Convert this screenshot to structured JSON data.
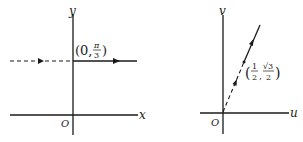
{
  "left_plot": {
    "x_axis_label": "x",
    "y_axis_label": "y",
    "origin_label": "O",
    "point_label": {
      "open": "(0,",
      "frac_num": "π",
      "frac_den": "3",
      "close": ")"
    },
    "line": {
      "description": "horizontal line y = π/3, dashed for x<0, solid for x>0, arrows pointing right"
    }
  },
  "right_plot": {
    "x_axis_label": "u",
    "y_axis_label": "v",
    "origin_label": "O",
    "point_label": {
      "open": "(",
      "frac1_num": "1",
      "frac1_den": "2",
      "sep": ",",
      "frac2_num": "√3",
      "frac2_den": "2",
      "close": ")"
    },
    "line": {
      "description": "ray from origin through (1/2, √3/2), dashed from origin to point, solid beyond, arrows pointing outward"
    }
  },
  "colors": {
    "ink": "#1a1a1a",
    "background": "#ffffff"
  }
}
